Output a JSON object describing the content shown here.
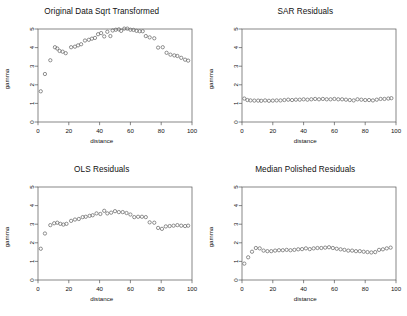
{
  "figure": {
    "layout": "2x2",
    "background": "#ffffff",
    "point_color": "#6b6b6b",
    "axis_color": "#555555",
    "text_color": "#111111"
  },
  "chart_data": [
    {
      "type": "scatter",
      "title": "Original Data Sqrt Transformed",
      "xlabel": "distance",
      "ylabel": "gamma",
      "xlim": [
        0,
        100
      ],
      "ylim": [
        0,
        5
      ],
      "xticks": [
        0,
        20,
        40,
        60,
        80,
        100
      ],
      "yticks": [
        0,
        1,
        2,
        3,
        4,
        5
      ],
      "grid": false,
      "legend": null,
      "x": [
        1.8,
        4.5,
        8.0,
        11.0,
        12.5,
        14.0,
        16.0,
        18.0,
        21.5,
        24.0,
        26.0,
        28.0,
        30.5,
        33.0,
        35.0,
        37.0,
        39.0,
        41.0,
        43.0,
        45.0,
        47.0,
        48.5,
        50.5,
        52.5,
        54.0,
        56.0,
        58.0,
        60.0,
        62.0,
        64.0,
        66.0,
        68.0,
        70.0,
        72.5,
        75.5,
        78.0,
        81.0,
        83.5,
        86.0,
        88.5,
        90.5,
        93.0,
        95.5,
        97.5
      ],
      "y": [
        1.65,
        2.58,
        3.32,
        4.02,
        3.95,
        3.82,
        3.78,
        3.7,
        4.02,
        4.05,
        4.12,
        4.18,
        4.38,
        4.42,
        4.48,
        4.52,
        4.72,
        4.78,
        4.6,
        4.85,
        4.62,
        4.92,
        4.96,
        4.98,
        4.9,
        5.02,
        5.02,
        4.96,
        4.95,
        4.9,
        4.88,
        4.88,
        4.62,
        4.55,
        4.5,
        4.0,
        4.02,
        3.72,
        3.62,
        3.58,
        3.55,
        3.45,
        3.35,
        3.3
      ]
    },
    {
      "type": "scatter",
      "title": "SAR Residuals",
      "xlabel": "distance",
      "ylabel": "gamma",
      "xlim": [
        0,
        100
      ],
      "ylim": [
        0,
        5
      ],
      "xticks": [
        0,
        20,
        40,
        60,
        80,
        100
      ],
      "yticks": [
        0,
        1,
        2,
        3,
        4,
        5
      ],
      "grid": false,
      "legend": null,
      "x": [
        1.5,
        3.5,
        5.5,
        8.0,
        10.5,
        12.5,
        15.0,
        17.5,
        20.0,
        22.5,
        25.0,
        27.5,
        30.0,
        32.5,
        35.0,
        37.5,
        40.0,
        42.5,
        45.0,
        47.5,
        50.0,
        52.5,
        55.0,
        57.5,
        60.0,
        62.5,
        65.0,
        67.5,
        70.0,
        72.5,
        75.0,
        77.5,
        80.0,
        82.5,
        85.0,
        87.5,
        90.0,
        92.5,
        95.0,
        97.0
      ],
      "y": [
        1.26,
        1.18,
        1.16,
        1.15,
        1.15,
        1.14,
        1.16,
        1.14,
        1.15,
        1.16,
        1.16,
        1.18,
        1.2,
        1.18,
        1.2,
        1.2,
        1.22,
        1.2,
        1.22,
        1.24,
        1.22,
        1.24,
        1.22,
        1.22,
        1.24,
        1.22,
        1.22,
        1.2,
        1.18,
        1.16,
        1.22,
        1.2,
        1.18,
        1.18,
        1.16,
        1.2,
        1.24,
        1.24,
        1.26,
        1.28
      ]
    },
    {
      "type": "scatter",
      "title": "OLS Residuals",
      "xlabel": "distance",
      "ylabel": "gamma",
      "xlim": [
        0,
        100
      ],
      "ylim": [
        0,
        5
      ],
      "xticks": [
        0,
        20,
        40,
        60,
        80,
        100
      ],
      "yticks": [
        0,
        1,
        2,
        3,
        4,
        5
      ],
      "grid": false,
      "legend": null,
      "x": [
        1.8,
        4.5,
        8.0,
        10.5,
        12.5,
        14.5,
        16.5,
        18.5,
        21.5,
        24.0,
        26.5,
        29.0,
        31.0,
        33.5,
        35.5,
        38.0,
        40.5,
        43.0,
        45.0,
        47.5,
        50.0,
        52.5,
        55.0,
        57.5,
        60.0,
        62.5,
        65.0,
        67.5,
        70.0,
        72.5,
        75.5,
        78.0,
        80.5,
        83.0,
        85.5,
        88.0,
        90.5,
        93.0,
        95.5,
        97.5
      ],
      "y": [
        1.68,
        2.5,
        2.95,
        3.05,
        3.08,
        3.02,
        2.98,
        3.02,
        3.18,
        3.25,
        3.28,
        3.38,
        3.4,
        3.45,
        3.48,
        3.58,
        3.55,
        3.72,
        3.58,
        3.62,
        3.7,
        3.65,
        3.65,
        3.6,
        3.52,
        3.38,
        3.4,
        3.4,
        3.38,
        3.1,
        3.08,
        2.8,
        2.75,
        2.88,
        2.9,
        2.92,
        2.95,
        2.92,
        2.9,
        2.92
      ]
    },
    {
      "type": "scatter",
      "title": "Median Polished Residuals",
      "xlabel": "distance",
      "ylabel": "gamma",
      "xlim": [
        0,
        100
      ],
      "ylim": [
        0,
        5
      ],
      "xticks": [
        0,
        20,
        40,
        60,
        80,
        100
      ],
      "yticks": [
        0,
        1,
        2,
        3,
        4,
        5
      ],
      "grid": false,
      "legend": null,
      "x": [
        1.5,
        4.0,
        6.5,
        9.0,
        11.5,
        14.0,
        16.5,
        19.0,
        21.5,
        24.0,
        26.5,
        29.0,
        31.5,
        34.0,
        36.5,
        39.0,
        41.5,
        44.0,
        46.5,
        49.0,
        51.5,
        54.0,
        56.5,
        59.0,
        61.5,
        64.0,
        66.5,
        69.0,
        71.5,
        74.0,
        76.5,
        79.0,
        81.5,
        84.0,
        86.5,
        89.0,
        91.5,
        94.0,
        96.5
      ],
      "y": [
        0.88,
        1.22,
        1.52,
        1.72,
        1.7,
        1.58,
        1.55,
        1.55,
        1.58,
        1.6,
        1.6,
        1.62,
        1.6,
        1.62,
        1.65,
        1.66,
        1.7,
        1.66,
        1.7,
        1.72,
        1.72,
        1.74,
        1.76,
        1.72,
        1.68,
        1.65,
        1.62,
        1.58,
        1.58,
        1.55,
        1.55,
        1.52,
        1.5,
        1.48,
        1.5,
        1.62,
        1.65,
        1.7,
        1.74
      ]
    }
  ]
}
